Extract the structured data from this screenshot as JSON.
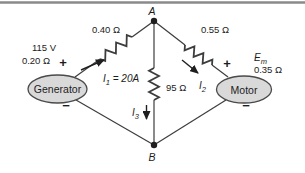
{
  "diagram": {
    "node_a": "A",
    "node_b": "B",
    "generator": {
      "label": "Generator",
      "voltage": "115 V",
      "internal_resistance": "0.20 Ω",
      "plus": "+",
      "minus": "−"
    },
    "motor": {
      "label": "Motor",
      "emf_symbol": "E",
      "emf_subscript": "m",
      "internal_resistance": "0.35 Ω",
      "plus": "+",
      "minus": "−"
    },
    "resistors": {
      "left": "0.40 Ω",
      "right": "0.55 Ω",
      "middle": "95 Ω"
    },
    "currents": {
      "i1": {
        "symbol": "I",
        "subscript": "1",
        "suffix": " = 20A"
      },
      "i2": {
        "symbol": "I",
        "subscript": "2"
      },
      "i3": {
        "symbol": "I",
        "subscript": "3"
      }
    }
  },
  "colors": {
    "wire": "#3d3d3d",
    "component_fill": "#d9d9d9",
    "component_stroke": "#4a4a4a",
    "text": "#1c1c1c",
    "top_border": "#8a8a8a",
    "background": "#ffffff"
  }
}
